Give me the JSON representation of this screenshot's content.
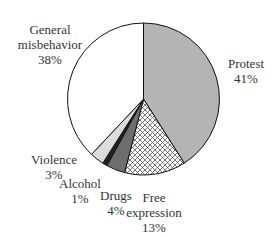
{
  "chart_data": {
    "type": "pie",
    "title": "",
    "start_angle_deg": 0,
    "direction": "clockwise",
    "slices": [
      {
        "label": "Protest",
        "value": 41,
        "pct_label": "41%",
        "fill": "#b4b4b4",
        "pattern": "solid"
      },
      {
        "label": "Free expression",
        "value": 13,
        "pct_label": "13%",
        "fill": "#ffffff",
        "pattern": "crosshatch"
      },
      {
        "label": "Drugs",
        "value": 4,
        "pct_label": "4%",
        "fill": "#6e6e6e",
        "pattern": "solid"
      },
      {
        "label": "Alcohol",
        "value": 1,
        "pct_label": "1%",
        "fill": "#222222",
        "pattern": "solid"
      },
      {
        "label": "Violence",
        "value": 3,
        "pct_label": "3%",
        "fill": "#dcdcdc",
        "pattern": "solid"
      },
      {
        "label": "General misbehavior",
        "value": 38,
        "pct_label": "38%",
        "fill": "#ffffff",
        "pattern": "solid"
      }
    ]
  },
  "labels": {
    "protest": {
      "name": "Protest",
      "pct": "41%"
    },
    "free_expression": {
      "name1": "Free",
      "name2": "expression",
      "pct": "13%"
    },
    "drugs": {
      "name": "Drugs",
      "pct": "4%"
    },
    "alcohol": {
      "name": "Alcohol",
      "pct": "1%"
    },
    "violence": {
      "name": "Violence",
      "pct": "3%"
    },
    "general": {
      "name1": "General",
      "name2": "misbehavior",
      "pct": "38%"
    }
  }
}
